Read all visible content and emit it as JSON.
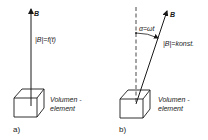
{
  "panels": [
    {
      "id": "a",
      "caption": "a)",
      "vector_label": "B",
      "magnitude_label": "|B|=f(t)",
      "element_label_line1": "Volumen -",
      "element_label_line2": "element"
    },
    {
      "id": "b",
      "caption": "b)",
      "vector_label": "B",
      "angle_label": "α=ωt",
      "magnitude_label": "|B|=konst.",
      "element_label_line1": "Volumen -",
      "element_label_line2": "element"
    }
  ],
  "colors": {
    "ink": "#1a1a1a",
    "background": "#ffffff"
  }
}
